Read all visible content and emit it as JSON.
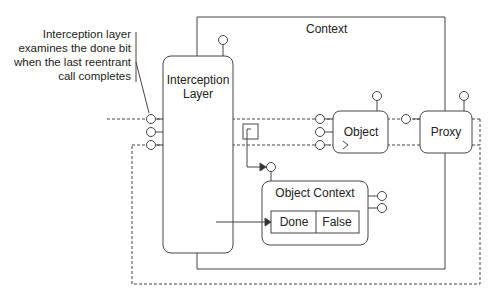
{
  "diagram": {
    "annotation": {
      "lines": [
        "Interception layer",
        "examines the done bit",
        "when the last reentrant",
        "call completes"
      ]
    },
    "context": {
      "label": "Context"
    },
    "interception_layer": {
      "label_line1": "Interception",
      "label_line2": "Layer"
    },
    "object": {
      "label": "Object"
    },
    "proxy": {
      "label": "Proxy"
    },
    "object_context": {
      "label": "Object Context",
      "table": {
        "key": "Done",
        "value": "False"
      }
    },
    "colors": {
      "stroke": "#444444",
      "text": "#222222",
      "background": "#ffffff"
    }
  }
}
